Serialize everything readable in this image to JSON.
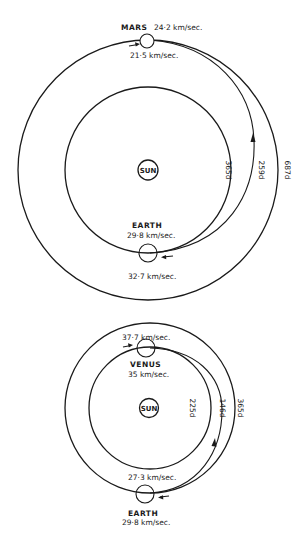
{
  "diagrams": [
    {
      "name": "earth-to-mars-transfer",
      "sun_label": "SUN",
      "outer_planet": {
        "name": "MARS",
        "orbital_speed": "24·2 km/sec.",
        "period": "687d"
      },
      "inner_planet": {
        "name": "EARTH",
        "orbital_speed": "29·8 km/sec.",
        "period": "365d"
      },
      "transfer": {
        "departure_speed": "32·7 km/sec.",
        "arrival_speed": "21·5 km/sec.",
        "duration": "259d"
      }
    },
    {
      "name": "earth-to-venus-transfer",
      "sun_label": "SUN",
      "outer_planet": {
        "name": "EARTH",
        "orbital_speed": "29·8 km/sec.",
        "period": "365d"
      },
      "inner_planet": {
        "name": "VENUS",
        "orbital_speed": "35 km/sec.",
        "period": "225d"
      },
      "transfer": {
        "departure_speed": "27·3 km/sec.",
        "arrival_speed": "37·7 km/sec.",
        "duration": "146d"
      }
    }
  ]
}
